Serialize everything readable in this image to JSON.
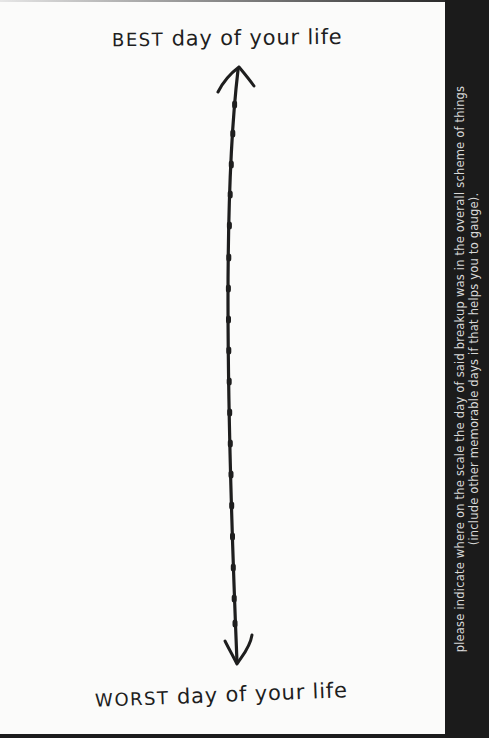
{
  "scale": {
    "top_label": {
      "emphasis": "BEST",
      "rest": " day of your life"
    },
    "bottom_label": {
      "emphasis": "WORST",
      "rest": " day of your life"
    },
    "arrow": {
      "type": "double-headed-vertical",
      "tick_count": 19,
      "color": "#1e1e1e"
    }
  },
  "instructions": {
    "line1": "please indicate where on the scale the day of said breakup was in the overall scheme of things",
    "line2": "(include other memorable days if that helps you to gauge)."
  },
  "colors": {
    "page_background": "#fbfbfa",
    "ink": "#1e1e1e",
    "side_panel": "#1b1b1b",
    "side_text": "#d8d8d8"
  }
}
